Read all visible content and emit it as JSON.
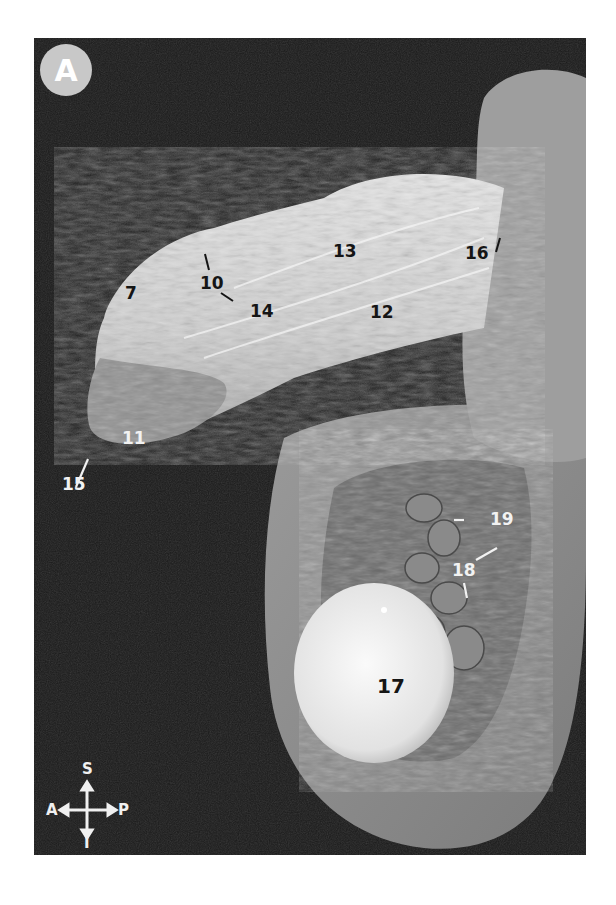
{
  "figure": {
    "panel_label": "A",
    "background_color": "#1a1a1a",
    "labels": [
      {
        "id": "7",
        "text": "7",
        "tone": "dark"
      },
      {
        "id": "10",
        "text": "10",
        "tone": "dark"
      },
      {
        "id": "11",
        "text": "11",
        "tone": "light"
      },
      {
        "id": "12",
        "text": "12",
        "tone": "dark"
      },
      {
        "id": "13",
        "text": "13",
        "tone": "dark"
      },
      {
        "id": "14",
        "text": "14",
        "tone": "dark"
      },
      {
        "id": "15",
        "text": "15",
        "tone": "light"
      },
      {
        "id": "16",
        "text": "16",
        "tone": "dark"
      },
      {
        "id": "17",
        "text": "17",
        "tone": "dark"
      },
      {
        "id": "18",
        "text": "18",
        "tone": "light"
      },
      {
        "id": "19",
        "text": "19",
        "tone": "light"
      }
    ],
    "orientation": {
      "superior": "S",
      "inferior": "I",
      "anterior": "A",
      "posterior": "P"
    }
  }
}
